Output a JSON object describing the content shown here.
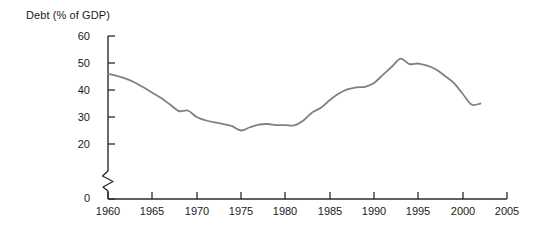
{
  "chart_data": {
    "type": "line",
    "title": "Debt (% of GDP)",
    "xlabel": "",
    "ylabel": "Debt (% of GDP)",
    "xlim": [
      1960,
      2005
    ],
    "ylim": [
      20,
      60
    ],
    "y_axis_break": true,
    "y_break_between": [
      0,
      20
    ],
    "grid": false,
    "legend": "none",
    "line_color": "#808080",
    "axis_color": "#2b2b2b",
    "yticks": [
      0,
      20,
      30,
      40,
      50,
      60
    ],
    "ytick_labels": [
      "0",
      "20",
      "30",
      "40",
      "50",
      "60"
    ],
    "xticks": [
      1960,
      1965,
      1970,
      1975,
      1980,
      1985,
      1990,
      1995,
      2000,
      2005
    ],
    "xtick_labels": [
      "1960",
      "1965",
      "1970",
      "1975",
      "1980",
      "1985",
      "1990",
      "1995",
      "2000",
      "2005"
    ],
    "series": [
      {
        "name": "Debt (% of GDP)",
        "x": [
          1960,
          1961,
          1962,
          1963,
          1964,
          1965,
          1966,
          1967,
          1968,
          1969,
          1970,
          1971,
          1972,
          1973,
          1974,
          1975,
          1976,
          1977,
          1978,
          1979,
          1980,
          1981,
          1982,
          1983,
          1984,
          1985,
          1986,
          1987,
          1988,
          1989,
          1990,
          1991,
          1992,
          1993,
          1994,
          1995,
          1996,
          1997,
          1998,
          1999,
          2000,
          2001,
          2002
        ],
        "values": [
          46.0,
          45.2,
          44.2,
          42.8,
          41.0,
          39.0,
          37.0,
          34.6,
          32.2,
          32.4,
          30.0,
          28.8,
          28.0,
          27.4,
          26.6,
          25.0,
          26.2,
          27.2,
          27.4,
          27.0,
          27.0,
          26.9,
          28.6,
          31.6,
          33.4,
          36.2,
          38.6,
          40.2,
          41.0,
          41.2,
          42.6,
          45.6,
          48.6,
          51.6,
          49.6,
          49.8,
          49.0,
          47.6,
          45.2,
          42.6,
          38.6,
          34.6,
          35.0
        ]
      }
    ]
  },
  "axes": {
    "y_zero_label": "0",
    "break_marker": "axis-break-zigzag"
  }
}
